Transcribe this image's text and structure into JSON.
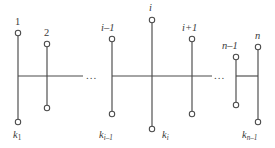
{
  "figure": {
    "kind": "caterpillar-graph-diagram",
    "stroke_color": "#4a4a4a",
    "node_fill": "#ffffff",
    "spine": {
      "y": 76,
      "segments": [
        [
          18,
          83
        ],
        [
          112,
          212
        ],
        [
          236,
          258
        ]
      ]
    },
    "ellipsis": [
      {
        "text": "...",
        "x": 88,
        "y": 70
      },
      {
        "text": "...",
        "x": 216,
        "y": 70
      }
    ],
    "branches": [
      {
        "id": "b1",
        "x": 18,
        "top_y": 33,
        "bottom_y": 122,
        "top_label": "1",
        "bottom_label": "k",
        "bottom_sub": "1",
        "top_label_x": 14,
        "top_label_y": 18,
        "bottom_label_x": 13,
        "bottom_label_y": 131
      },
      {
        "id": "b2",
        "x": 47,
        "top_y": 44,
        "bottom_y": 108,
        "top_label": "2",
        "bottom_label": "",
        "bottom_sub": "",
        "top_label_x": 43,
        "top_label_y": 29,
        "bottom_label_x": 0,
        "bottom_label_y": 0
      },
      {
        "id": "bi-1",
        "x": 112,
        "top_y": 39,
        "bottom_y": 114,
        "top_label": "i–1",
        "bottom_label": "k",
        "bottom_sub": "i–1",
        "top_label_x": 101,
        "top_label_y": 24,
        "bottom_label_x": 99,
        "bottom_label_y": 131
      },
      {
        "id": "bi",
        "x": 152,
        "top_y": 20,
        "bottom_y": 129,
        "top_label": "i",
        "bottom_label": "k",
        "bottom_sub": "i",
        "top_label_x": 149,
        "top_label_y": 4,
        "bottom_label_x": 162,
        "bottom_label_y": 131
      },
      {
        "id": "bi+1",
        "x": 192,
        "top_y": 39,
        "bottom_y": 114,
        "top_label": "i+1",
        "bottom_label": "",
        "bottom_sub": "",
        "top_label_x": 182,
        "top_label_y": 24,
        "bottom_label_x": 0,
        "bottom_label_y": 0
      },
      {
        "id": "bn-1",
        "x": 236,
        "top_y": 57,
        "bottom_y": 105,
        "top_label": "n–1",
        "bottom_label": "",
        "bottom_sub": "",
        "top_label_x": 222,
        "top_label_y": 42,
        "bottom_label_x": 0,
        "bottom_label_y": 0
      },
      {
        "id": "bn",
        "x": 258,
        "top_y": 47,
        "bottom_y": 122,
        "top_label": "n",
        "bottom_label": "k",
        "bottom_sub": "n–1",
        "top_label_x": 255,
        "top_label_y": 32,
        "bottom_label_x": 243,
        "bottom_label_y": 131
      }
    ]
  },
  "labels": {
    "top": {
      "v1": "1",
      "v2": "2",
      "vi_minus_1": "i–1",
      "vi": "i",
      "vi_plus_1": "i+1",
      "vn_minus_1": "n–1",
      "vn": "n"
    },
    "bottom": {
      "k1_base": "k",
      "k1_sub": "1",
      "ki_minus_1_base": "k",
      "ki_minus_1_sub": "i–1",
      "ki_base": "k",
      "ki_sub": "i",
      "kn_minus_1_base": "k",
      "kn_minus_1_sub": "n–1"
    },
    "ellipsis_left": "...",
    "ellipsis_right": "..."
  }
}
